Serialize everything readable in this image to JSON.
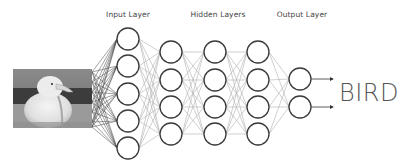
{
  "labels": {
    "input": "Input Layer",
    "hidden": "Hidden Layers",
    "output": "Output Layer"
  },
  "prediction": "BIRD",
  "input_image": {
    "subject": "seagull-photo",
    "style": "grayscale"
  },
  "network": {
    "layers": [
      {
        "name": "input",
        "x": 128,
        "nodes": [
          39,
          66,
          94,
          121,
          148
        ]
      },
      {
        "name": "hidden-1",
        "x": 171,
        "nodes": [
          52,
          80,
          107,
          134
        ]
      },
      {
        "name": "hidden-2",
        "x": 215,
        "nodes": [
          52,
          80,
          107,
          134
        ]
      },
      {
        "name": "hidden-3",
        "x": 258,
        "nodes": [
          52,
          80,
          107,
          134
        ]
      },
      {
        "name": "output",
        "x": 300,
        "nodes": [
          79,
          107
        ]
      }
    ],
    "node_radius": 11,
    "colors": {
      "node_stroke": "#3a3a3a",
      "edge": "#b0b0b0",
      "input_edge": "#444444",
      "text": "#555555"
    }
  }
}
